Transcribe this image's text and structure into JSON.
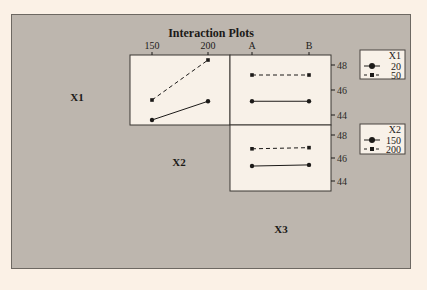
{
  "chart_data": {
    "type": "line",
    "title": "Interaction Plots",
    "factors": [
      "X1",
      "X2",
      "X3"
    ],
    "diagonal_labels": [
      "X1",
      "X2",
      "X3"
    ],
    "panels": [
      {
        "name": "X1 x X2",
        "x_factor": "X2",
        "trace_factor": "X1",
        "x_ticks": [
          "150",
          "200"
        ],
        "y_ticks": [
          "48",
          "46",
          "44"
        ],
        "ylim": [
          43,
          49
        ],
        "series": [
          {
            "name": "20",
            "style": "solid-circle",
            "x": [
              150,
              200
            ],
            "values": [
              43.6,
              45.1
            ]
          },
          {
            "name": "50",
            "style": "dashed-square",
            "x": [
              150,
              200
            ],
            "values": [
              45.2,
              48.4
            ]
          }
        ]
      },
      {
        "name": "X1 x X3",
        "x_factor": "X3",
        "trace_factor": "X1",
        "x_ticks": [
          "A",
          "B"
        ],
        "y_ticks": [
          "48",
          "46",
          "44"
        ],
        "ylim": [
          43,
          49
        ],
        "series": [
          {
            "name": "20",
            "style": "solid-circle",
            "x": [
              "A",
              "B"
            ],
            "values": [
              45.1,
              45.1
            ]
          },
          {
            "name": "50",
            "style": "dashed-square",
            "x": [
              "A",
              "B"
            ],
            "values": [
              47.2,
              47.2
            ]
          }
        ]
      },
      {
        "name": "X2 x X3",
        "x_factor": "X3",
        "trace_factor": "X2",
        "x_ticks": [
          "A",
          "B"
        ],
        "y_ticks": [
          "48",
          "46",
          "44"
        ],
        "ylim": [
          43,
          49
        ],
        "series": [
          {
            "name": "150",
            "style": "solid-circle",
            "x": [
              "A",
              "B"
            ],
            "values": [
              45.3,
              45.4
            ]
          },
          {
            "name": "200",
            "style": "dashed-square",
            "x": [
              "A",
              "B"
            ],
            "values": [
              46.8,
              46.9
            ]
          }
        ]
      }
    ],
    "legends": [
      {
        "title": "X1",
        "entries": [
          {
            "label": "20",
            "style": "solid-circle"
          },
          {
            "label": "50",
            "style": "dashed-square"
          }
        ]
      },
      {
        "title": "X2",
        "entries": [
          {
            "label": "150",
            "style": "solid-circle"
          },
          {
            "label": "200",
            "style": "dashed-square"
          }
        ]
      }
    ],
    "xlabel": "",
    "ylabel": "",
    "grid": false
  },
  "colors": {
    "page_bg": "#fbf1e6",
    "panel_bg": "#bdb6ae",
    "plot_bg": "#f8f1e8",
    "ink": "#1c1a18"
  }
}
